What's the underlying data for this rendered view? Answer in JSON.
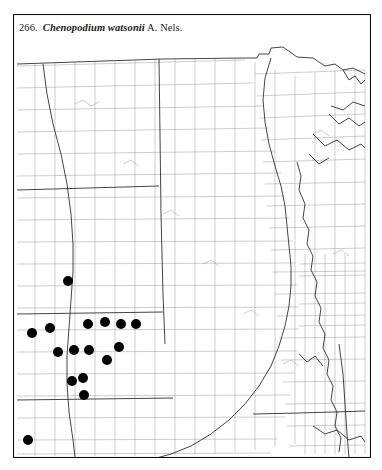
{
  "caption": {
    "number": "266.",
    "binomial": "Chenopodium watsonii",
    "authority": "A. Nels."
  },
  "map": {
    "kind": "species-distribution-dot-map",
    "region": "North Central United States",
    "frame_color": "#0d0d0d",
    "county_line_color": "#8a8a8a",
    "state_line_color": "#2a2a2a",
    "dot_color": "#000000",
    "background_color": "#ffffff",
    "dot_radius_px": 5,
    "occurrence_count": 16,
    "occurrences": [
      {
        "id": "occ-1",
        "x": 68,
        "y": 281
      },
      {
        "id": "occ-2",
        "x": 105,
        "y": 322
      },
      {
        "id": "occ-3",
        "x": 88,
        "y": 324
      },
      {
        "id": "occ-4",
        "x": 121,
        "y": 324
      },
      {
        "id": "occ-5",
        "x": 136,
        "y": 324
      },
      {
        "id": "occ-6",
        "x": 50,
        "y": 328
      },
      {
        "id": "occ-7",
        "x": 32,
        "y": 333
      },
      {
        "id": "occ-8",
        "x": 119,
        "y": 347
      },
      {
        "id": "occ-9",
        "x": 74,
        "y": 350
      },
      {
        "id": "occ-10",
        "x": 89,
        "y": 350
      },
      {
        "id": "occ-11",
        "x": 58,
        "y": 352
      },
      {
        "id": "occ-12",
        "x": 107,
        "y": 360
      },
      {
        "id": "occ-13",
        "x": 83,
        "y": 378
      },
      {
        "id": "occ-14",
        "x": 72,
        "y": 381
      },
      {
        "id": "occ-15",
        "x": 84,
        "y": 395
      },
      {
        "id": "occ-16",
        "x": 28,
        "y": 440
      }
    ]
  }
}
